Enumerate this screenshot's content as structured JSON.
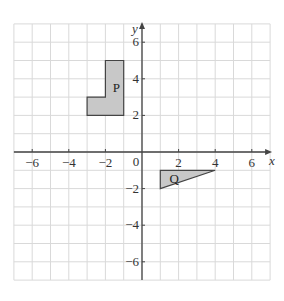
{
  "diagram": {
    "type": "coordinate-grid",
    "x_axis": {
      "label": "x",
      "min": -7,
      "max": 7,
      "ticks": [
        -6,
        -4,
        -2,
        2,
        4,
        6
      ]
    },
    "y_axis": {
      "label": "y",
      "min": -7,
      "max": 7,
      "ticks": [
        6,
        4,
        2,
        -2,
        -4,
        -6
      ]
    },
    "origin_label": "0",
    "grid_color": "#d9d9d9",
    "axis_color": "#444444",
    "shape_fill": "#c8c8c8",
    "shape_stroke": "#444444",
    "shapes": [
      {
        "label": "P",
        "vertices": [
          [
            -3,
            2
          ],
          [
            -1,
            2
          ],
          [
            -1,
            5
          ],
          [
            -2,
            5
          ],
          [
            -2,
            3
          ],
          [
            -3,
            3
          ]
        ],
        "label_pos": [
          -1.6,
          3.5
        ]
      },
      {
        "label": "Q",
        "vertices": [
          [
            1,
            -1
          ],
          [
            4,
            -1
          ],
          [
            1,
            -2
          ]
        ],
        "label_pos": [
          1.5,
          -1.45
        ]
      }
    ]
  }
}
